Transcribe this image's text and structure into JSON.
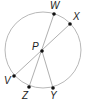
{
  "diagram": {
    "type": "circle-geometry",
    "circle": {
      "cx": 43,
      "cy": 50,
      "r": 38,
      "stroke": "#b8b8b8"
    },
    "points": [
      {
        "name": "W",
        "x": 54,
        "y": 14,
        "lx": 50,
        "ly": 9
      },
      {
        "name": "X",
        "x": 70,
        "y": 24,
        "lx": 73,
        "ly": 20
      },
      {
        "name": "P",
        "x": 42,
        "y": 51,
        "lx": 32,
        "ly": 50
      },
      {
        "name": "V",
        "x": 14,
        "y": 76,
        "lx": 4,
        "ly": 84
      },
      {
        "name": "Z",
        "x": 29,
        "y": 87,
        "lx": 22,
        "ly": 99
      },
      {
        "name": "Y",
        "x": 53,
        "y": 88,
        "lx": 50,
        "ly": 99
      }
    ],
    "segments": [
      {
        "from": "W",
        "to": "Z"
      },
      {
        "from": "X",
        "to": "V"
      },
      {
        "from": "P",
        "to": "Y"
      }
    ],
    "line_color": "#b0b0b0",
    "point_color": "#111111"
  }
}
